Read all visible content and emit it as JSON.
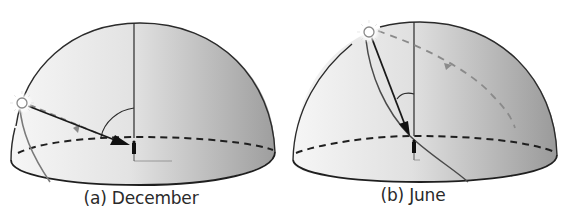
{
  "figure": {
    "panels": [
      {
        "id": "a",
        "caption": "(a) December",
        "season": "December",
        "sun_position": "low in sky, near horizon (south-east side)",
        "elements": [
          "celestial hemisphere",
          "zenith line",
          "horizon (dashed)",
          "sun",
          "sun ray arrow",
          "zenith angle arc",
          "sun path arc",
          "observer"
        ]
      },
      {
        "id": "b",
        "caption": "(b) June",
        "season": "June",
        "sun_position": "high in sky, near zenith",
        "elements": [
          "celestial hemisphere",
          "zenith line",
          "horizon (dashed)",
          "sun",
          "sun ray arrow",
          "zenith angle arc",
          "sun path arc",
          "observer"
        ]
      }
    ],
    "colors": {
      "dome_light": "#f2f2f2",
      "dome_dark": "#a9a9a9",
      "outline": "#2b2b2b",
      "sun_path": "#7a7a7a",
      "dashed_path": "#8a8a8a",
      "text": "#2a2a2a"
    }
  }
}
